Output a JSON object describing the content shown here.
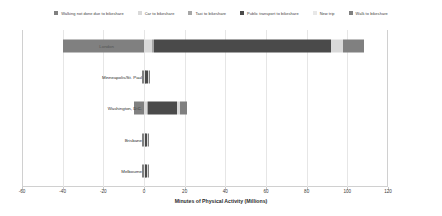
{
  "chart_data": {
    "type": "bar",
    "orientation": "horizontal",
    "stacked": true,
    "title": "",
    "xlabel": "Minutes of Physical Activity (Millions)",
    "ylabel": "",
    "xlim": [
      -60,
      120
    ],
    "xticks": [
      -60,
      -40,
      -20,
      0,
      20,
      40,
      60,
      80,
      100,
      120
    ],
    "xticklabels": [
      "-60",
      "-40",
      "-20",
      "0",
      "20",
      "40",
      "60",
      "80",
      "100",
      "120"
    ],
    "grid": true,
    "legend_position": "top",
    "categories": [
      "London",
      "Minneapolis/St. Paul",
      "Washington, D.C.",
      "Brisbane",
      "Melbourne"
    ],
    "series": [
      {
        "name": "Walking not done due to bikeshare",
        "color": "#808080",
        "values": [
          -40.0,
          -1.0,
          -5.0,
          -1.2,
          -1.2
        ]
      },
      {
        "name": "Car to bikeshare",
        "color": "#d9d9d9",
        "values": [
          4.0,
          0.4,
          1.5,
          0.4,
          0.4
        ]
      },
      {
        "name": "Taxi to bikeshare",
        "color": "#a6a6a6",
        "values": [
          1.0,
          0.2,
          0.5,
          0.2,
          0.2
        ]
      },
      {
        "name": "Public transport to bikeshare",
        "color": "#4a4a4a",
        "values": [
          87.0,
          1.6,
          14.0,
          1.0,
          1.0
        ]
      },
      {
        "name": "New trip",
        "color": "#d9d9d9",
        "values": [
          6.0,
          0.3,
          1.5,
          0.3,
          0.3
        ]
      },
      {
        "name": "Walk to bikeshare",
        "color": "#808080",
        "values": [
          10.0,
          0.5,
          3.5,
          0.5,
          0.5
        ]
      }
    ],
    "totals_positive": [
      108.0,
      3.0,
      21.0,
      2.4,
      2.4
    ],
    "bar_start": [
      -40.0,
      -1.0,
      -5.0,
      -1.2,
      -1.2
    ]
  },
  "legend": {
    "items": [
      {
        "label": "Walking not done due to bikeshare",
        "color": "#808080"
      },
      {
        "label": "Car to bikeshare",
        "color": "#d9d9d9"
      },
      {
        "label": "Taxi to bikeshare",
        "color": "#a6a6a6"
      },
      {
        "label": "Public transport to bikeshare",
        "color": "#4a4a4a"
      },
      {
        "label": "New trip",
        "color": "#e8e8e8"
      },
      {
        "label": "Walk to bikeshare",
        "color": "#808080"
      }
    ]
  }
}
